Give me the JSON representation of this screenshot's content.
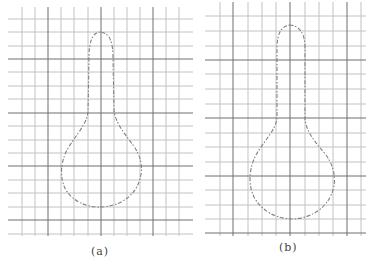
{
  "figure": {
    "panels": [
      {
        "id": "a",
        "caption": "(a)"
      },
      {
        "id": "b",
        "caption": "(b)"
      }
    ]
  },
  "colors": {
    "grid_minor": "#bdbdbd",
    "grid_major": "#6f6f6f",
    "outline": "#808080",
    "background": "#ffffff"
  }
}
